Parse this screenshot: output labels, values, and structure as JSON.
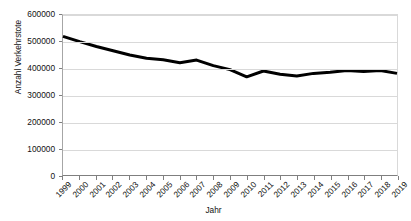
{
  "chart_data": {
    "type": "line",
    "title": "",
    "subtitle": "",
    "xlabel": "Jahr",
    "ylabel": "Anzahl Verkehrstote",
    "x": [
      1999,
      2000,
      2001,
      2002,
      2003,
      2004,
      2005,
      2006,
      2007,
      2008,
      2009,
      2010,
      2011,
      2012,
      2013,
      2014,
      2015,
      2016,
      2017,
      2018,
      2019
    ],
    "categories": [
      "1999",
      "2000",
      "2001",
      "2002",
      "2003",
      "2004",
      "2005",
      "2006",
      "2007",
      "2008",
      "2009",
      "2010",
      "2011",
      "2012",
      "2013",
      "2014",
      "2015",
      "2016",
      "2017",
      "2018",
      "2019"
    ],
    "values": [
      520000,
      500000,
      482000,
      466000,
      450000,
      438000,
      432000,
      421000,
      431000,
      410000,
      395000,
      368000,
      390000,
      378000,
      371000,
      381000,
      385000,
      392000,
      388000,
      392000,
      381000
    ],
    "series": [
      {
        "name": "Anzahl Verkehrstote",
        "values": [
          520000,
          500000,
          482000,
          466000,
          450000,
          438000,
          432000,
          421000,
          431000,
          410000,
          395000,
          368000,
          390000,
          378000,
          371000,
          381000,
          385000,
          392000,
          388000,
          392000,
          381000
        ],
        "color": "#000000"
      }
    ],
    "ylim": [
      0,
      600000
    ],
    "yticks": [
      0,
      100000,
      200000,
      300000,
      400000,
      500000,
      600000
    ],
    "ytick_labels": [
      "0",
      "100000",
      "200000",
      "300000",
      "400000",
      "500000",
      "600000"
    ],
    "xlim": [
      1999,
      2019
    ],
    "grid": "horizontal",
    "legend": "none",
    "line_width": 3,
    "colors": {
      "line": "#000000",
      "gridline": "#d9d9d9",
      "axis": "#7f7f7f",
      "background": "#ffffff",
      "text": "#111111"
    }
  }
}
